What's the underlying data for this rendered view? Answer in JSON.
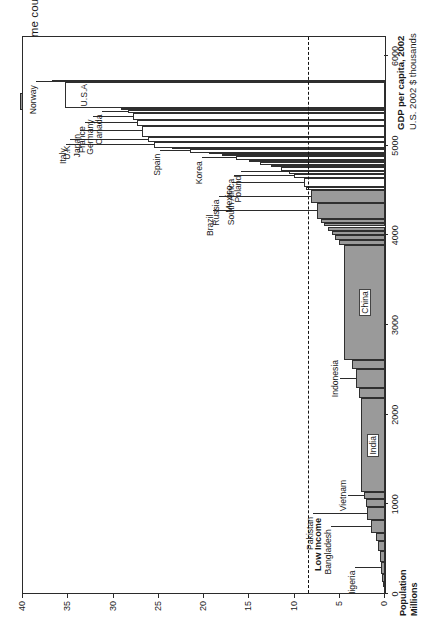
{
  "figure": {
    "legend": {
      "label": "Low-income countries",
      "swatch_color": "#9a9a9a"
    },
    "y_axis": {
      "title_bold": "GDP per capita, 2002",
      "title_sub": "U.S. 2002 $ thousands",
      "ticks": [
        "40",
        "35",
        "30",
        "25",
        "20",
        "15",
        "10",
        "5",
        "0"
      ],
      "min": 0,
      "max": 40
    },
    "x_axis": {
      "title_bold": "Population",
      "title_sub": "Millions",
      "ticks": [
        "0",
        "1000",
        "2000",
        "3000",
        "4000",
        "5000",
        "6000"
      ],
      "min": 0,
      "max": 6200
    },
    "threshold": {
      "value": 8.5,
      "label": "Low Income",
      "style": "dashed"
    }
  },
  "chart_data": {
    "type": "bar",
    "title": "GDP per capita, 2002",
    "xlabel": "Population (Millions)",
    "ylabel": "GDP per capita (U.S. 2002 $ thousands)",
    "xlim": [
      0,
      6200
    ],
    "ylim": [
      0,
      40
    ],
    "grid": false,
    "legend_position": "top-left",
    "orientation": "rotated-90-ccw",
    "threshold_line": 8.5,
    "series": [
      {
        "name": "Ethiopia",
        "population": 68,
        "gdp_per_capita": 0.12,
        "low_income": true,
        "label": null
      },
      {
        "name": "Congo DR",
        "population": 52,
        "gdp_per_capita": 0.2,
        "low_income": true,
        "label": null
      },
      {
        "name": "Other low A",
        "population": 95,
        "gdp_per_capita": 0.32,
        "low_income": true,
        "label": null
      },
      {
        "name": "Nigeria",
        "population": 133,
        "gdp_per_capita": 0.42,
        "low_income": true,
        "label": "Nigeria"
      },
      {
        "name": "Other low B",
        "population": 120,
        "gdp_per_capita": 0.55,
        "low_income": true,
        "label": null
      },
      {
        "name": "Other low C",
        "population": 110,
        "gdp_per_capita": 0.72,
        "low_income": true,
        "label": null
      },
      {
        "name": "Other low D",
        "population": 95,
        "gdp_per_capita": 0.95,
        "low_income": true,
        "label": null
      },
      {
        "name": "Bangladesh",
        "population": 136,
        "gdp_per_capita": 1.6,
        "low_income": true,
        "label": "Bangladesh"
      },
      {
        "name": "Pakistan",
        "population": 146,
        "gdp_per_capita": 1.95,
        "low_income": true,
        "label": "Pakistan"
      },
      {
        "name": "Other low E",
        "population": 90,
        "gdp_per_capita": 2.1,
        "low_income": true,
        "label": null
      },
      {
        "name": "Vietnam",
        "population": 80,
        "gdp_per_capita": 2.3,
        "low_income": true,
        "label": "Vietnam"
      },
      {
        "name": "India",
        "population": 1049,
        "gdp_per_capita": 2.65,
        "low_income": true,
        "label": "India"
      },
      {
        "name": "Other low F",
        "population": 110,
        "gdp_per_capita": 2.9,
        "low_income": true,
        "label": null
      },
      {
        "name": "Indonesia",
        "population": 212,
        "gdp_per_capita": 3.2,
        "low_income": true,
        "label": "Indonesia"
      },
      {
        "name": "Other low G",
        "population": 100,
        "gdp_per_capita": 3.6,
        "low_income": true,
        "label": null
      },
      {
        "name": "China",
        "population": 1281,
        "gdp_per_capita": 4.5,
        "low_income": true,
        "label": "China"
      },
      {
        "name": "Other mid A",
        "population": 60,
        "gdp_per_capita": 5.1,
        "low_income": true,
        "label": null
      },
      {
        "name": "Other mid B",
        "population": 55,
        "gdp_per_capita": 5.5,
        "low_income": true,
        "label": null
      },
      {
        "name": "Other mid C",
        "population": 45,
        "gdp_per_capita": 5.9,
        "low_income": true,
        "label": null
      },
      {
        "name": "Other mid D",
        "population": 50,
        "gdp_per_capita": 6.3,
        "low_income": true,
        "label": null
      },
      {
        "name": "Other mid E",
        "population": 40,
        "gdp_per_capita": 6.7,
        "low_income": true,
        "label": null
      },
      {
        "name": "Other mid F",
        "population": 45,
        "gdp_per_capita": 7.1,
        "low_income": true,
        "label": null
      },
      {
        "name": "Brazil",
        "population": 174,
        "gdp_per_capita": 7.5,
        "low_income": true,
        "label": "Brazil"
      },
      {
        "name": "Russia",
        "population": 144,
        "gdp_per_capita": 8.2,
        "low_income": true,
        "label": "Russia"
      },
      {
        "name": "Other mid G",
        "population": 35,
        "gdp_per_capita": 8.7,
        "low_income": false,
        "label": null
      },
      {
        "name": "Mexico",
        "population": 101,
        "gdp_per_capita": 9.0,
        "low_income": false,
        "label": "Mexico"
      },
      {
        "name": "South Africa",
        "population": 45,
        "gdp_per_capita": 10.1,
        "low_income": false,
        "label": "South Africa"
      },
      {
        "name": "Poland",
        "population": 39,
        "gdp_per_capita": 10.6,
        "low_income": false,
        "label": "Poland"
      },
      {
        "name": "Other upper A",
        "population": 38,
        "gdp_per_capita": 11.5,
        "low_income": false,
        "label": null
      },
      {
        "name": "Other upper B",
        "population": 30,
        "gdp_per_capita": 12.6,
        "low_income": false,
        "label": null
      },
      {
        "name": "Other upper C",
        "population": 25,
        "gdp_per_capita": 13.8,
        "low_income": false,
        "label": null
      },
      {
        "name": "Other upper D",
        "population": 22,
        "gdp_per_capita": 15.0,
        "low_income": false,
        "label": null
      },
      {
        "name": "Korea",
        "population": 48,
        "gdp_per_capita": 16.5,
        "low_income": false,
        "label": "Korea"
      },
      {
        "name": "Other upper E",
        "population": 20,
        "gdp_per_capita": 18.0,
        "low_income": false,
        "label": null
      },
      {
        "name": "Other upper F",
        "population": 18,
        "gdp_per_capita": 19.5,
        "low_income": false,
        "label": null
      },
      {
        "name": "Spain",
        "population": 41,
        "gdp_per_capita": 21.5,
        "low_income": false,
        "label": "Spain"
      },
      {
        "name": "Other upper G",
        "population": 15,
        "gdp_per_capita": 23.5,
        "low_income": false,
        "label": null
      },
      {
        "name": "Italy",
        "population": 58,
        "gdp_per_capita": 25.5,
        "low_income": false,
        "label": "Italy"
      },
      {
        "name": "U.K.",
        "population": 59,
        "gdp_per_capita": 26.2,
        "low_income": false,
        "label": "U.K."
      },
      {
        "name": "Japan",
        "population": 127,
        "gdp_per_capita": 26.9,
        "low_income": false,
        "label": "Japan"
      },
      {
        "name": "France",
        "population": 59,
        "gdp_per_capita": 27.4,
        "low_income": false,
        "label": "France"
      },
      {
        "name": "Germany",
        "population": 82,
        "gdp_per_capita": 27.8,
        "low_income": false,
        "label": "Germany"
      },
      {
        "name": "Canada",
        "population": 31,
        "gdp_per_capita": 28.4,
        "low_income": false,
        "label": "Canada"
      },
      {
        "name": "Other high A",
        "population": 22,
        "gdp_per_capita": 29.2,
        "low_income": false,
        "label": null
      },
      {
        "name": "U.S.A",
        "population": 288,
        "gdp_per_capita": 35.4,
        "low_income": false,
        "label": "U.S.A"
      },
      {
        "name": "Norway",
        "population": 5,
        "gdp_per_capita": 36.8,
        "low_income": false,
        "label": "Norway"
      }
    ],
    "callout_labels": [
      "Norway",
      "Canada",
      "Germany",
      "France",
      "Japan",
      "U.K.",
      "Italy",
      "Spain",
      "Korea",
      "Poland",
      "South Africa",
      "Mexico",
      "Russia",
      "Brazil",
      "China",
      "Indonesia",
      "India",
      "Vietnam",
      "Pakistan",
      "Bangladesh",
      "Nigeria",
      "U.S.A"
    ]
  }
}
